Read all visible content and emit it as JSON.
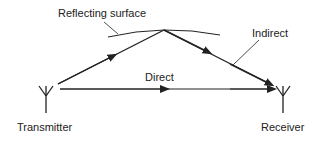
{
  "diagram": {
    "labels": {
      "surface": "Reflecting surface",
      "indirect": "Indirect",
      "direct": "Direct",
      "transmitter": "Transmitter",
      "receiver": "Receiver"
    },
    "nodes": [
      {
        "id": "transmitter",
        "label": "Transmitter",
        "icon": "antenna-icon"
      },
      {
        "id": "reflection-point",
        "label": "Reflecting surface"
      },
      {
        "id": "receiver",
        "label": "Receiver",
        "icon": "antenna-icon"
      }
    ],
    "edges": [
      {
        "from": "transmitter",
        "to": "receiver",
        "label": "Direct"
      },
      {
        "from": "transmitter",
        "to": "reflection-point",
        "label": "Indirect"
      },
      {
        "from": "reflection-point",
        "to": "receiver",
        "label": "Indirect"
      }
    ],
    "colors": {
      "ink": "#222222",
      "background": "#ffffff"
    }
  }
}
